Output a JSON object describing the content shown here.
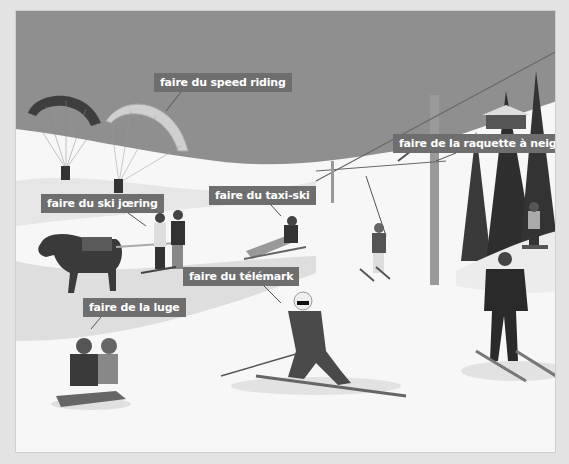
{
  "illustration": {
    "subject": "winter sports activities",
    "colors": {
      "sky": "#8f8f8f",
      "snow": "#f7f7f7",
      "snow_shadow": "#dcdcdc",
      "label_bg": "#6e6e6e",
      "label_text": "#ffffff"
    },
    "labels": [
      {
        "id": "speed-riding",
        "text": "faire du speed riding"
      },
      {
        "id": "raquette",
        "text": "faire de la raquette à neige"
      },
      {
        "id": "ski-joering",
        "text": "faire du ski jœring"
      },
      {
        "id": "taxi-ski",
        "text": "faire du taxi-ski"
      },
      {
        "id": "telemark",
        "text": "faire du télémark"
      },
      {
        "id": "luge",
        "text": "faire de la luge"
      }
    ]
  }
}
